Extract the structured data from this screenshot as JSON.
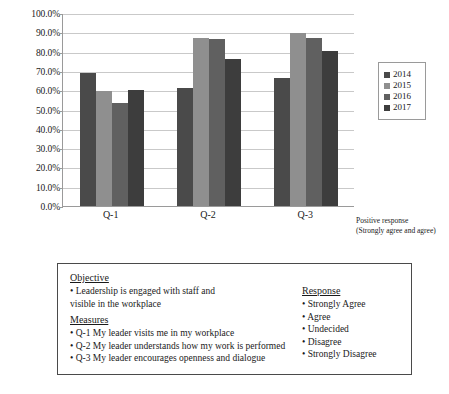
{
  "chart_data": {
    "type": "bar",
    "title": "",
    "xlabel": "",
    "ylabel": "",
    "ylim": [
      0,
      100
    ],
    "grid": true,
    "legend_position": "right",
    "categories": [
      "Q-1",
      "Q-2",
      "Q-3"
    ],
    "y_ticks": [
      "0.0%",
      "10.0%",
      "20.0%",
      "30.0%",
      "40.0%",
      "50.0%",
      "60.0%",
      "70.0%",
      "80.0%",
      "90.0%",
      "100.0%"
    ],
    "y_tick_values": [
      0,
      10,
      20,
      30,
      40,
      50,
      60,
      70,
      80,
      90,
      100
    ],
    "series": [
      {
        "name": "2014",
        "color": "#4a4a4a",
        "values": [
          68.7,
          61.3,
          66.2
        ]
      },
      {
        "name": "2015",
        "color": "#8f8f8f",
        "values": [
          59.4,
          87.0,
          89.4
        ]
      },
      {
        "name": "2016",
        "color": "#606060",
        "values": [
          53.4,
          86.3,
          87.0
        ]
      },
      {
        "name": "2017",
        "color": "#3d3d3d",
        "values": [
          60.2,
          76.3,
          80.2
        ]
      }
    ],
    "axis_caption": {
      "line1": "Positive response",
      "line2": "(Strongly agree and agree)"
    }
  },
  "info_box": {
    "objective": {
      "heading": "Objective",
      "items": [
        "• Leadership is engaged with staff and",
        "visible in the workplace"
      ]
    },
    "measures": {
      "heading": "Measures",
      "items": [
        "• Q-1 My leader visits me in my workplace",
        "• Q-2 My leader understands how my work is performed",
        "• Q-3 My leader encourages openness and dialogue"
      ]
    },
    "response": {
      "heading": "Response",
      "items": [
        "• Strongly Agree",
        "• Agree",
        "• Undecided",
        "• Disagree",
        "• Strongly Disagree"
      ]
    }
  }
}
